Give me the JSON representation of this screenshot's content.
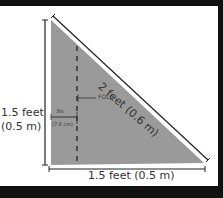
{
  "diagram": {
    "type": "right-triangle-template",
    "fill_color": "#9a9a9a",
    "frame_color": "#111111",
    "labels": {
      "left_side_line1": "1.5 feet",
      "left_side_line2": "(0.5 m)",
      "bottom_side": "1.5 feet (0.5 m)",
      "hypotenuse": "2 feet (0.6 m)",
      "fold": "FOLD",
      "fold_offset_in": "3in",
      "fold_offset_cm": "(7.6 cm)"
    }
  }
}
